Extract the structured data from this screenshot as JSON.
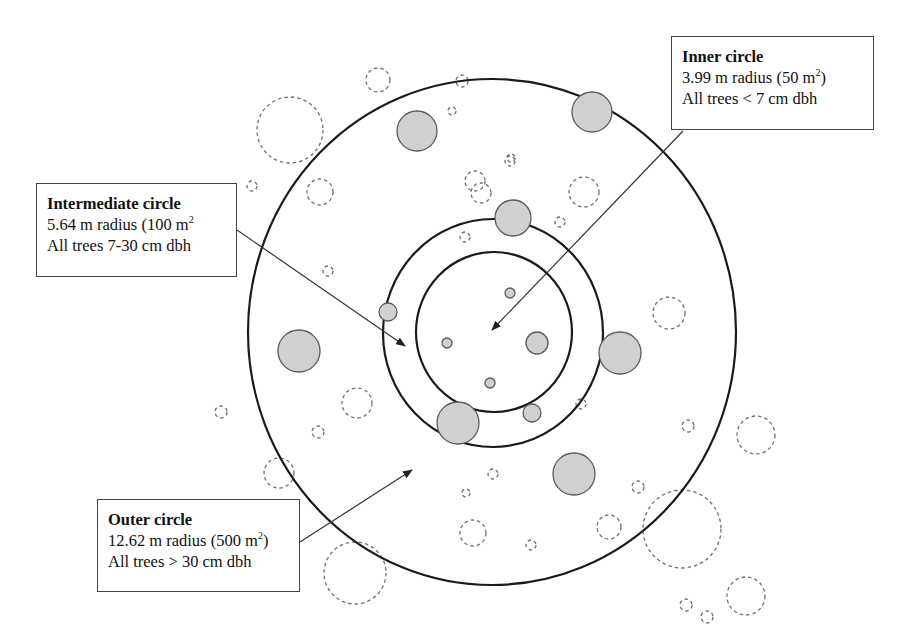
{
  "figure": {
    "colors": {
      "background": "#ffffff",
      "plot_ring_stroke": "#1a1a1a",
      "tree_fill": "#d0d0d0",
      "tree_stroke": "#5a5a5a",
      "excluded_tree_stroke": "#707070",
      "arrow": "#333333",
      "box_border": "#444444"
    }
  },
  "labels": {
    "inner": {
      "title": "Inner circle",
      "radius_text": "3.99 m radius (50 m",
      "radius_sup": "2",
      "radius_close": ")",
      "criteria": "All trees < 7 cm dbh"
    },
    "intermediate": {
      "title": "Intermediate circle",
      "radius_text": "5.64 m radius (100 m",
      "radius_sup": "2",
      "radius_close": "",
      "criteria": "All trees 7-30 cm dbh"
    },
    "outer": {
      "title": "Outer circle",
      "radius_text": "12.62 m radius (500 m",
      "radius_sup": "2",
      "radius_close": ")",
      "criteria": "All trees > 30 cm dbh"
    }
  },
  "plot_rings": [
    {
      "name": "outer",
      "cx": 492,
      "cy": 332,
      "rx": 244,
      "ry": 253
    },
    {
      "name": "intermediate",
      "cx": 493,
      "cy": 333,
      "rx": 110,
      "ry": 114
    },
    {
      "name": "inner",
      "cx": 494,
      "cy": 332,
      "rx": 78,
      "ry": 80
    }
  ],
  "measured_trees": [
    {
      "cx": 417,
      "cy": 131,
      "r": 20
    },
    {
      "cx": 592,
      "cy": 112,
      "r": 20
    },
    {
      "cx": 513,
      "cy": 218,
      "r": 18
    },
    {
      "cx": 388,
      "cy": 312,
      "r": 9
    },
    {
      "cx": 299,
      "cy": 351,
      "r": 21
    },
    {
      "cx": 620,
      "cy": 353,
      "r": 21
    },
    {
      "cx": 537,
      "cy": 343,
      "r": 11
    },
    {
      "cx": 510,
      "cy": 293,
      "r": 5
    },
    {
      "cx": 447,
      "cy": 343,
      "r": 5
    },
    {
      "cx": 490,
      "cy": 383,
      "r": 5
    },
    {
      "cx": 532,
      "cy": 413,
      "r": 9
    },
    {
      "cx": 458,
      "cy": 423,
      "r": 21
    },
    {
      "cx": 574,
      "cy": 474,
      "r": 21
    }
  ],
  "excluded_trees": [
    {
      "cx": 290,
      "cy": 130,
      "r": 33
    },
    {
      "cx": 378,
      "cy": 80,
      "r": 12
    },
    {
      "cx": 462,
      "cy": 81,
      "r": 6
    },
    {
      "cx": 452,
      "cy": 111,
      "r": 4
    },
    {
      "cx": 252,
      "cy": 186,
      "r": 5
    },
    {
      "cx": 320,
      "cy": 192,
      "r": 13
    },
    {
      "cx": 475,
      "cy": 181,
      "r": 10
    },
    {
      "cx": 510,
      "cy": 161,
      "r": 5
    },
    {
      "cx": 511,
      "cy": 158,
      "r": 4
    },
    {
      "cx": 481,
      "cy": 193,
      "r": 10
    },
    {
      "cx": 560,
      "cy": 222,
      "r": 5
    },
    {
      "cx": 584,
      "cy": 192,
      "r": 15
    },
    {
      "cx": 465,
      "cy": 237,
      "r": 5
    },
    {
      "cx": 328,
      "cy": 271,
      "r": 5
    },
    {
      "cx": 669,
      "cy": 313,
      "r": 16
    },
    {
      "cx": 357,
      "cy": 403,
      "r": 15
    },
    {
      "cx": 221,
      "cy": 412,
      "r": 6
    },
    {
      "cx": 318,
      "cy": 432,
      "r": 6
    },
    {
      "cx": 581,
      "cy": 404,
      "r": 5
    },
    {
      "cx": 688,
      "cy": 426,
      "r": 6
    },
    {
      "cx": 756,
      "cy": 435,
      "r": 19
    },
    {
      "cx": 279,
      "cy": 473,
      "r": 15
    },
    {
      "cx": 493,
      "cy": 474,
      "r": 5
    },
    {
      "cx": 466,
      "cy": 493,
      "r": 4
    },
    {
      "cx": 638,
      "cy": 487,
      "r": 6
    },
    {
      "cx": 473,
      "cy": 533,
      "r": 13
    },
    {
      "cx": 531,
      "cy": 545,
      "r": 5
    },
    {
      "cx": 609,
      "cy": 527,
      "r": 12
    },
    {
      "cx": 682,
      "cy": 529,
      "r": 39
    },
    {
      "cx": 355,
      "cy": 573,
      "r": 31
    },
    {
      "cx": 746,
      "cy": 596,
      "r": 19
    },
    {
      "cx": 686,
      "cy": 605,
      "r": 6
    },
    {
      "cx": 707,
      "cy": 617,
      "r": 6
    }
  ],
  "arrows": [
    {
      "name": "inner-arrow",
      "x1": 683,
      "y1": 131,
      "x2": 492,
      "y2": 330
    },
    {
      "name": "intermediate-arrow",
      "x1": 237,
      "y1": 230,
      "x2": 405,
      "y2": 346
    },
    {
      "name": "outer-arrow",
      "x1": 300,
      "y1": 542,
      "x2": 412,
      "y2": 470
    }
  ]
}
